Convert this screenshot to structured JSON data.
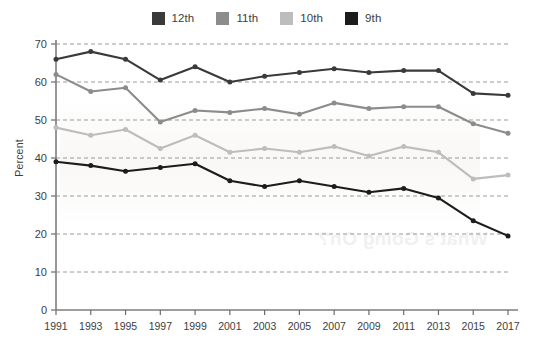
{
  "chart_data": {
    "type": "line",
    "title": "",
    "xlabel": "",
    "ylabel": "Percent",
    "categories": [
      "1991",
      "1993",
      "1995",
      "1997",
      "1999",
      "2001",
      "2003",
      "2005",
      "2007",
      "2009",
      "2011",
      "2013",
      "2015",
      "2017"
    ],
    "x": [
      1991,
      1993,
      1995,
      1997,
      1999,
      2001,
      2003,
      2005,
      2007,
      2009,
      2011,
      2013,
      2015,
      2017
    ],
    "ylim": [
      0,
      70
    ],
    "yticks": [
      0,
      10,
      20,
      30,
      40,
      50,
      60,
      70
    ],
    "grid": true,
    "grid_style": "dashed-horizontal",
    "legend_position": "top-center",
    "series": [
      {
        "name": "12th",
        "color": "#3a3a3a",
        "values": [
          66.0,
          68.0,
          66.0,
          60.5,
          64.0,
          60.0,
          61.5,
          62.5,
          63.5,
          62.5,
          63.0,
          63.0,
          57.0,
          56.5
        ]
      },
      {
        "name": "11th",
        "color": "#8c8c8c",
        "values": [
          62.0,
          57.5,
          58.5,
          49.5,
          52.5,
          52.0,
          53.0,
          51.5,
          54.5,
          53.0,
          53.5,
          53.5,
          49.0,
          46.5
        ]
      },
      {
        "name": "10th",
        "color": "#bdbdbd",
        "values": [
          48.0,
          46.0,
          47.5,
          42.5,
          46.0,
          41.5,
          42.5,
          41.5,
          43.0,
          40.5,
          43.0,
          41.5,
          34.5,
          35.5
        ]
      },
      {
        "name": "9th",
        "color": "#1c1c1c",
        "values": [
          39.0,
          38.0,
          36.5,
          37.5,
          38.5,
          34.0,
          32.5,
          34.0,
          32.5,
          31.0,
          32.0,
          29.5,
          23.5,
          19.5
        ]
      }
    ]
  },
  "legend": {
    "items": [
      {
        "label": "12th",
        "color": "#3a3a3a"
      },
      {
        "label": "11th",
        "color": "#8c8c8c"
      },
      {
        "label": "10th",
        "color": "#bdbdbd"
      },
      {
        "label": "9th",
        "color": "#1c1c1c"
      }
    ]
  },
  "axes": {
    "y_axis_label": "Percent",
    "y_tick_labels": [
      "70",
      "60",
      "50",
      "40",
      "30",
      "20",
      "10",
      "0"
    ],
    "x_tick_labels": [
      "1991",
      "1993",
      "1995",
      "1997",
      "1999",
      "2001",
      "2003",
      "2005",
      "2007",
      "2009",
      "2011",
      "2013",
      "2015",
      "2017"
    ]
  },
  "artifacts": {
    "bleed_text": "What's Going On?"
  }
}
